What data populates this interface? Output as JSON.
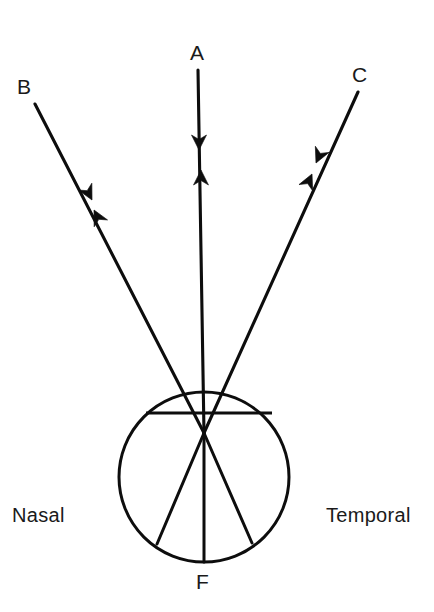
{
  "figure": {
    "background_color": "#ffffff",
    "ink_color": "#0d0d0d",
    "width": 434,
    "height": 612
  },
  "labels": {
    "ray_a": "A",
    "ray_b": "B",
    "ray_c": "C",
    "fovea": "F",
    "nasal": "Nasal",
    "temporal": "Temporal"
  },
  "diagram_data": {
    "type": "diagram",
    "eye": {
      "name": "eyeball",
      "center_x": 204,
      "center_y": 477,
      "radius": 85
    },
    "nodal_point": {
      "x": 204,
      "y": 433
    },
    "cornea_chord": {
      "x1": 146,
      "y1": 413,
      "x2": 272,
      "y2": 413
    },
    "rays": [
      {
        "id": "A",
        "label": "A",
        "description": "central ray on the visual axis",
        "object_end": {
          "x": 198,
          "y": 70
        },
        "nodal_point": {
          "x": 204,
          "y": 433
        },
        "retinal_end": {
          "x": 204,
          "y": 562
        },
        "arrowheads": [
          {
            "direction": "toward-eye",
            "x": 199,
            "y": 148,
            "angle_deg": 90
          },
          {
            "direction": "toward-object",
            "x": 201,
            "y": 180,
            "angle_deg": 270
          }
        ]
      },
      {
        "id": "B",
        "label": "B",
        "description": "ray from nasal field entering to temporal retina",
        "object_end": {
          "x": 35,
          "y": 104
        },
        "nodal_point": {
          "x": 204,
          "y": 433
        },
        "retinal_end": {
          "x": 157,
          "y": 544
        },
        "arrowheads": [
          {
            "direction": "toward-eye",
            "x": 88,
            "y": 196,
            "angle_deg": 62
          },
          {
            "direction": "toward-object",
            "x": 100,
            "y": 218,
            "angle_deg": 242
          }
        ]
      },
      {
        "id": "C",
        "label": "C",
        "description": "ray from temporal field entering to nasal retina",
        "object_end": {
          "x": 358,
          "y": 92
        },
        "nodal_point": {
          "x": 204,
          "y": 433
        },
        "retinal_end": {
          "x": 252,
          "y": 543
        },
        "arrowheads": [
          {
            "direction": "toward-eye",
            "x": 320,
            "y": 158,
            "angle_deg": 114
          },
          {
            "direction": "toward-object",
            "x": 307,
            "y": 184,
            "angle_deg": 294
          }
        ]
      }
    ],
    "annotations": [
      {
        "id": "nasal",
        "text": "Nasal",
        "side": "left",
        "x": 12,
        "y": 516
      },
      {
        "id": "temporal",
        "text": "Temporal",
        "side": "right",
        "x": 326,
        "y": 516
      },
      {
        "id": "fovea",
        "text": "F",
        "position": "below-eye",
        "x": 204,
        "y": 583
      }
    ]
  }
}
